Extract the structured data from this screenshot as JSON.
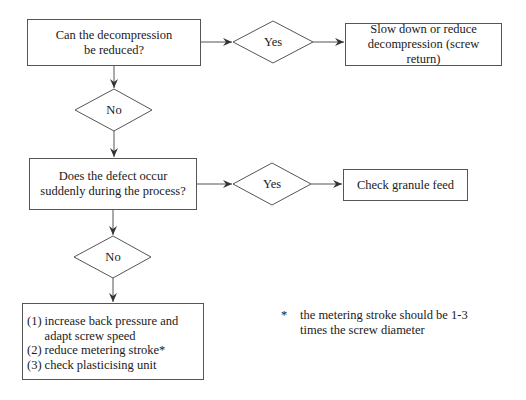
{
  "flowchart": {
    "q1": {
      "text": "Can the decompression be reduced?"
    },
    "q1_yes": {
      "label": "Yes"
    },
    "q1_yes_action": {
      "text": "Slow down or reduce decompression (screw return)"
    },
    "q1_no": {
      "label": "No"
    },
    "q2": {
      "text": "Does the defect occur suddenly during the process?"
    },
    "q2_yes": {
      "label": "Yes"
    },
    "q2_yes_action": {
      "text": "Check granule feed"
    },
    "q2_no": {
      "label": "No"
    },
    "final_actions": {
      "items": [
        {
          "num": "(1)",
          "text": "increase back pressure and adapt screw speed"
        },
        {
          "num": "(2)",
          "text": "reduce metering stroke*"
        },
        {
          "num": "(3)",
          "text": "check plasticising unit"
        }
      ]
    },
    "footnote": {
      "marker": "*",
      "text": "the metering stroke should be 1-3 times the screw diameter"
    }
  },
  "colors": {
    "line": "#555555",
    "text": "#1a1a1a",
    "background": "#ffffff"
  }
}
